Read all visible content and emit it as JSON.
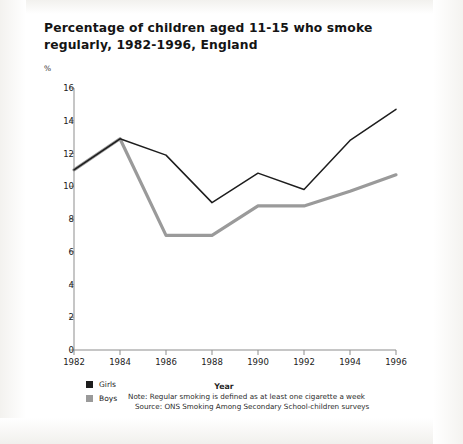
{
  "figure": {
    "title": "Percentage of children aged 11-15 who smoke regularly, 1982-1996, England",
    "unit_label": "%",
    "note": "Note: Regular smoking is defined as at least one cigarette a week",
    "source": "Source: ONS Smoking Among Secondary School-children surveys"
  },
  "legend": {
    "items": [
      {
        "label": "Girls",
        "color": "#1d1d1d"
      },
      {
        "label": "Boys",
        "color": "#9a9a9a"
      }
    ]
  },
  "chart_data": {
    "type": "line",
    "title": "Percentage of children aged 11-15 who smoke regularly, 1982-1996, England",
    "xlabel": "Year",
    "ylabel": "%",
    "x": [
      1982,
      1984,
      1986,
      1988,
      1990,
      1992,
      1994,
      1996
    ],
    "xtick_labels": [
      "1982",
      "1984",
      "1986",
      "1988",
      "1990",
      "1992",
      "1994",
      "1996"
    ],
    "ytick_labels": [
      "0",
      "2",
      "4",
      "6",
      "8",
      "10",
      "12",
      "14",
      "16"
    ],
    "xlim": [
      1982,
      1996
    ],
    "ylim": [
      0,
      16
    ],
    "ytick_step": 2,
    "grid": false,
    "legend_position": "bottom-left",
    "series": [
      {
        "name": "Girls",
        "color": "#1d1d1d",
        "values": [
          11.0,
          12.9,
          11.9,
          9.0,
          10.8,
          9.8,
          12.8,
          14.7
        ]
      },
      {
        "name": "Boys",
        "color": "#9a9a9a",
        "values": [
          11.0,
          12.9,
          7.0,
          7.0,
          8.8,
          8.8,
          9.7,
          10.7
        ]
      }
    ],
    "annotations": [
      "Note: Regular smoking is defined as at least one cigarette a week",
      "Source: ONS Smoking Among Secondary School-children surveys"
    ]
  }
}
